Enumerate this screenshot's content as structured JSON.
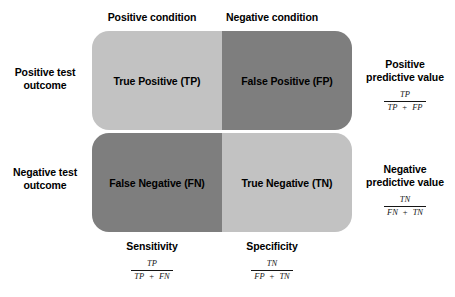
{
  "diagram": {
    "column_headers": [
      {
        "id": "positive-condition",
        "label": "Positive condition"
      },
      {
        "id": "negative-condition",
        "label": "Negative condition"
      }
    ],
    "row_headers": [
      {
        "id": "positive-test-outcome",
        "line1": "Positive test",
        "line2": "outcome"
      },
      {
        "id": "negative-test-outcome",
        "line1": "Negative test",
        "line2": "outcome"
      }
    ],
    "cells": [
      {
        "id": "true-positive",
        "label": "True Positive (TP)",
        "shade": "light",
        "color": "#c2c2c2"
      },
      {
        "id": "false-positive",
        "label": "False Positive (FP)",
        "shade": "dark",
        "color": "#7e7e7e"
      },
      {
        "id": "false-negative",
        "label": "False Negative (FN)",
        "shade": "dark",
        "color": "#7e7e7e"
      },
      {
        "id": "true-negative",
        "label": "True Negative (TN)",
        "shade": "light",
        "color": "#c2c2c2"
      }
    ],
    "side_metrics": [
      {
        "id": "positive-predictive-value",
        "line1": "Positive",
        "line2": "predictive value",
        "formula": {
          "numerator": "TP",
          "denom_left": "TP",
          "operator": "+",
          "denom_right": "FP"
        }
      },
      {
        "id": "negative-predictive-value",
        "line1": "Negative",
        "line2": "predictive value",
        "formula": {
          "numerator": "TN",
          "denom_left": "FN",
          "operator": "+",
          "denom_right": "TN"
        }
      }
    ],
    "bottom_metrics": [
      {
        "id": "sensitivity",
        "label": "Sensitivity",
        "formula": {
          "numerator": "TP",
          "denom_left": "TP",
          "operator": "+",
          "denom_right": "FN"
        }
      },
      {
        "id": "specificity",
        "label": "Specificity",
        "formula": {
          "numerator": "TN",
          "denom_left": "FP",
          "operator": "+",
          "denom_right": "TN"
        }
      }
    ],
    "colors": {
      "background": "#ffffff",
      "text": "#000000",
      "cell_light": "#c2c2c2",
      "cell_dark": "#7e7e7e"
    }
  }
}
